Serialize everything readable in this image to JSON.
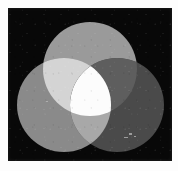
{
  "figure": {
    "medium": "black-and-white photographic print",
    "canvas": {
      "width": 178,
      "height": 171,
      "background_color": "#fdfdfd"
    },
    "plate": {
      "label": "black photographic plate",
      "x": 8,
      "y": 8,
      "width": 164,
      "height": 153,
      "background_color": "#080808"
    }
  },
  "chart_data": {
    "type": "venn",
    "subtitle": "",
    "grid": false,
    "legend_position": "none",
    "set_count": 3,
    "background_color": "#080808",
    "circle_radius": 47,
    "sets": [
      {
        "name": "top",
        "semantic_name": "green-primary",
        "center_x": 90,
        "center_y": 69,
        "radius": 47,
        "fill": "#9a9a9a",
        "value": 1
      },
      {
        "name": "bottom-left",
        "semantic_name": "red-primary",
        "center_x": 64,
        "center_y": 105,
        "radius": 47,
        "fill": "#8a8a8a",
        "value": 1
      },
      {
        "name": "bottom-right",
        "semantic_name": "blue-primary",
        "center_x": 117,
        "center_y": 105,
        "radius": 47,
        "fill": "#4a4a4a",
        "value": 1
      }
    ],
    "intersections": [
      {
        "name": "top-and-bottom-left",
        "semantic_name": "yellow-secondary",
        "sets": [
          "top",
          "bottom-left"
        ],
        "fill": "#d4d4d4",
        "value": 1
      },
      {
        "name": "top-and-bottom-right",
        "semantic_name": "cyan-secondary",
        "sets": [
          "top",
          "bottom-right"
        ],
        "fill": "#5e5e5e",
        "value": 1
      },
      {
        "name": "bottom-left-and-bottom-right",
        "semantic_name": "magenta-secondary",
        "sets": [
          "bottom-left",
          "bottom-right"
        ],
        "fill": "#a8a8a8",
        "value": 1
      },
      {
        "name": "all-three",
        "semantic_name": "white-centre",
        "sets": [
          "top",
          "bottom-left",
          "bottom-right"
        ],
        "fill": "#fcfcfc",
        "value": 1
      }
    ],
    "artifacts": [
      {
        "name": "scan-speckle",
        "x": 129,
        "y": 133,
        "width": 3,
        "height": 2
      },
      {
        "name": "scan-speckle",
        "x": 134,
        "y": 136,
        "width": 2,
        "height": 1
      },
      {
        "name": "scan-speckle",
        "x": 124,
        "y": 137,
        "width": 4,
        "height": 1
      },
      {
        "name": "scan-speckle",
        "x": 46,
        "y": 101,
        "width": 2,
        "height": 1
      }
    ]
  }
}
